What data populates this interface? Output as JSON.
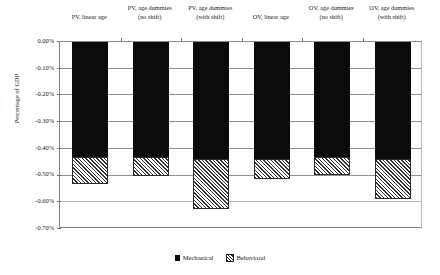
{
  "chart_data": {
    "type": "bar",
    "stacked": true,
    "title": "",
    "xlabel": "",
    "ylabel": "Percentage of GDP",
    "ylim": [
      -0.7,
      0.0
    ],
    "ytick_step": 0.1,
    "ytick_labels": [
      "0.00%",
      "-0.10%",
      "-0.20%",
      "-0.30%",
      "-0.40%",
      "-0.50%",
      "-0.60%",
      "-0.70%"
    ],
    "ytick_values": [
      0.0,
      -0.1,
      -0.2,
      -0.3,
      -0.4,
      -0.5,
      -0.6,
      -0.7
    ],
    "grid": true,
    "legend_position": "bottom",
    "categories": [
      "PV, linear age",
      "PV, age dummies (no shift)",
      "PV, age dummies (with shift)",
      "OV, linear age",
      "OV, age dummies (no shift)",
      "OV, age dummies (with shift)"
    ],
    "category_lines": [
      [
        "",
        "PV, linear age"
      ],
      [
        "PV, age dummies",
        "(no shift)"
      ],
      [
        "PV, age dummies",
        "(with shift)"
      ],
      [
        "",
        "OV, linear age"
      ],
      [
        "OV, age dummies",
        "(no shift)"
      ],
      [
        "OV, age dummies",
        "(with shift)"
      ]
    ],
    "series": [
      {
        "name": "Mechanical",
        "color": "#0b0b0b",
        "values": [
          -0.435,
          -0.435,
          -0.44,
          -0.44,
          -0.435,
          -0.44
        ]
      },
      {
        "name": "Behavioral",
        "color": "#ffffff",
        "pattern": "diagonal-hatch",
        "values": [
          -0.1,
          -0.07,
          -0.19,
          -0.075,
          -0.065,
          -0.15
        ]
      }
    ],
    "totals": [
      -0.535,
      -0.505,
      -0.63,
      -0.515,
      -0.5,
      -0.59
    ]
  },
  "legend": {
    "items": [
      {
        "label": "Mechanical",
        "swatch": "solid-black-swatch"
      },
      {
        "label": "Behavioral",
        "swatch": "hatched-swatch"
      }
    ]
  }
}
